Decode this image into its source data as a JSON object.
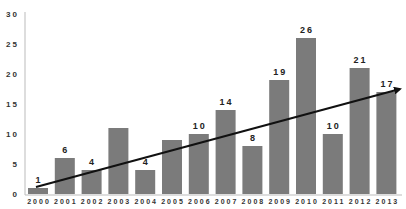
{
  "chart_data": {
    "type": "bar",
    "title": "",
    "xlabel": "",
    "ylabel": "",
    "ylim": [
      0,
      30
    ],
    "yticks": [
      0,
      5,
      10,
      15,
      20,
      25,
      30
    ],
    "grid": false,
    "legend": null,
    "categories": [
      "2000",
      "2001",
      "2002",
      "2003",
      "2004",
      "2005",
      "2006",
      "2007",
      "2008",
      "2009",
      "2010",
      "2011",
      "2012",
      "2013"
    ],
    "values": [
      1,
      6,
      4,
      11,
      4,
      9,
      10,
      14,
      8,
      19,
      26,
      10,
      21,
      17
    ],
    "data_labels": [
      "1",
      "6",
      "4",
      "",
      "4",
      "",
      "10",
      "14",
      "8",
      "19",
      "26",
      "10",
      "21",
      "17"
    ],
    "bar_color": "#7b7b7b",
    "annotations": [
      {
        "type": "trend-arrow",
        "from": {
          "x": "2000",
          "y": 1.2
        },
        "to": {
          "x": "2013+",
          "y": 17.5
        },
        "color": "#111111"
      }
    ]
  }
}
